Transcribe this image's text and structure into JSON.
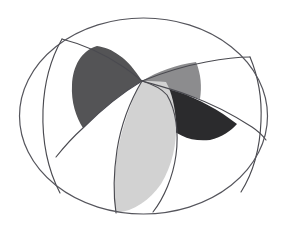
{
  "figure": {
    "type": "geometric-diagram",
    "canvas": {
      "width": 287,
      "height": 229,
      "background": "#ffffff"
    },
    "outer_ellipse": {
      "name": "boundary-ellipse",
      "center_x": 143.5,
      "center_y": 116,
      "radius_x": 124,
      "radius_y": 98,
      "stroke_color": "#55555c",
      "stroke_width": 1.2,
      "fill": "none",
      "path": "M 19.5 116 A 124 98 0 1 1 267.5 116 A 124 98 0 1 1 19.5 116 Z"
    },
    "center_point": {
      "name": "sector-convergence-point",
      "x": 142,
      "y": 81
    },
    "colors": {
      "dark_gray": "#545456",
      "medium_gray": "#8c8c8e",
      "near_black": "#2b2b2d",
      "light_gray": "#d2d2d2",
      "white": "#ffffff",
      "line": "#4a4a50"
    },
    "sectors": [
      {
        "name": "sector-upper-left-dark",
        "label": "upper-left dark wedge",
        "fill": "#545456",
        "path": "M 142 81 C 128 58 112 48 97 46 C 81 51 73 66 72 85 C 71 102 76 117 83 128 C 100 111 120 94 142 81 Z"
      },
      {
        "name": "sector-upper-right-medium",
        "label": "upper-right medium gray wedge",
        "fill": "#8c8c8e",
        "path": "M 142 81 C 158 71 176 65 196 62 C 201 74 202 87 200 99 C 184 95 166 91 152 92 C 148 88 145 84 142 81 Z"
      },
      {
        "name": "sector-right-black",
        "label": "right near-black wedge",
        "fill": "#2b2b2d",
        "path": "M 142 81 C 150 92 157 105 164 121 C 176 136 191 142 210 140 C 222 137 231 131 237 124 C 219 110 199 99 178 92 C 166 88 153 85 142 81 Z"
      },
      {
        "name": "sector-bottom-light",
        "label": "bottom large light gray wedge",
        "fill": "#d2d2d2",
        "path": "M 142 81 C 132 99 124 121 119 144 C 114 167 113 192 116 213 C 134 211 150 200 161 184 C 172 166 177 144 176 122 C 175 107 172 93 166 82 C 158 81 150 81 142 81 Z"
      }
    ],
    "arcs": [
      {
        "name": "arc-upper-left-outer",
        "description": "arc from left ellipse rim through upper-left wedge crest",
        "path": "M 62 39 C 82 44 104 54 122 66 C 130 71 136 76 142 81"
      },
      {
        "name": "arc-upper-left-inner",
        "description": "lower bound of upper-left dark wedge",
        "path": "M 142 81 C 120 94 100 111 83 128 C 73 137 64 147 56 157"
      },
      {
        "name": "arc-upper-right-outer",
        "description": "arc from center to upper-right ellipse rim",
        "path": "M 142 81 C 162 73 184 66 206 62 C 222 59 238 57 250 57"
      },
      {
        "name": "arc-right-lower",
        "description": "lower bound of right black wedge to ellipse rim",
        "path": "M 142 81 C 156 85 172 89 188 95 C 210 103 232 114 252 127 C 258 131 263 136 266 140"
      },
      {
        "name": "arc-bottom-left",
        "description": "left bound of bottom light wedge",
        "path": "M 142 81 C 130 101 121 125 117 150 C 114 170 113 193 116 213"
      },
      {
        "name": "arc-bottom-right",
        "description": "right bound of bottom light wedge",
        "path": "M 142 81 C 152 84 161 88 167 95 C 176 110 179 133 176 155 C 173 177 164 198 153 212"
      },
      {
        "name": "arc-left-chord",
        "description": "long chord crossing the lower-left of the ellipse",
        "path": "M 62 39 C 50 60 44 85 43 110 C 42 140 48 170 60 193"
      },
      {
        "name": "arc-right-chord",
        "description": "long chord crossing the lower-right of the ellipse",
        "path": "M 250 57 C 258 76 262 99 261 121 C 260 148 253 173 241 192"
      }
    ],
    "annotation": {
      "visible_text": "",
      "note": "No text or labels appear in the figure."
    }
  }
}
